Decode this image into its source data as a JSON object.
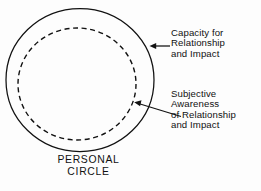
{
  "diagram": {
    "title_label": {
      "lines": [
        "PERSONAL",
        "CIRCLE"
      ],
      "line1": "PERSONAL",
      "line2": "CIRCLE"
    },
    "shapes": {
      "outer_circle": {
        "name": "personal-circle-outer",
        "stroke": "#111111",
        "style": "solid",
        "cx": 80,
        "cy": 80,
        "rx": 74,
        "ry": 71.5
      },
      "inner_circle": {
        "name": "subjective-awareness-inner",
        "stroke": "#111111",
        "style": "dashed",
        "cx": 77,
        "cy": 84,
        "rx": 59,
        "ry": 56
      }
    },
    "annotations": [
      {
        "id": "capacity",
        "lines": [
          "Capacity for",
          "Relationship",
          "and Impact"
        ],
        "line1": "Capacity for",
        "line2": "Relationship",
        "line3": "and Impact",
        "arrow": {
          "name": "capacity-arrow",
          "from_x": 170,
          "from_y": 46,
          "to_x": 150,
          "to_y": 46,
          "direction": "left"
        }
      },
      {
        "id": "subjective",
        "lines": [
          "Subjective",
          "Awareness",
          "of Relationship",
          "and Impact"
        ],
        "line1": "Subjective",
        "line2": "Awareness",
        "line3": "of Relationship",
        "line4": "and Impact",
        "arrow": {
          "name": "subjective-arrow",
          "from_x": 181,
          "from_y": 116,
          "to_x": 134,
          "to_y": 102,
          "direction": "upper-left"
        }
      }
    ],
    "colors": {
      "ink": "#111111",
      "background": "#fdfdfd"
    }
  }
}
